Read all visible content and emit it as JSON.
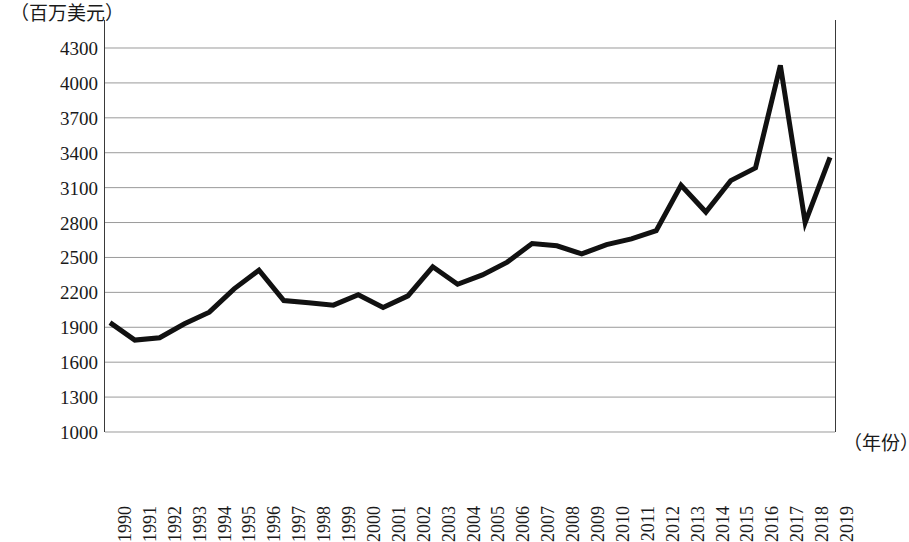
{
  "chart_data": {
    "type": "line",
    "title": "",
    "subtitle": "",
    "xlabel": "（年份）",
    "ylabel": "（百万美元）",
    "ylim": [
      1000,
      4300
    ],
    "ytick_step": 300,
    "yticks": [
      4300,
      4000,
      3700,
      3400,
      3100,
      2800,
      2500,
      2200,
      1900,
      1600,
      1300,
      1000
    ],
    "grid": "horizontal",
    "legend": "none",
    "line_color": "#111111",
    "line_width_px": 5,
    "categories": [
      "1990",
      "1991",
      "1992",
      "1993",
      "1994",
      "1995",
      "1996",
      "1997",
      "1998",
      "1999",
      "2000",
      "2001",
      "2002",
      "2003",
      "2004",
      "2005",
      "2006",
      "2007",
      "2008",
      "2009",
      "2010",
      "2011",
      "2012",
      "2013",
      "2014",
      "2015",
      "2016",
      "2017",
      "2018",
      "2019"
    ],
    "values": [
      1940,
      1790,
      1810,
      1930,
      2030,
      2230,
      2390,
      2130,
      2110,
      2090,
      2180,
      2070,
      2170,
      2420,
      2270,
      2350,
      2460,
      2620,
      2600,
      2530,
      2610,
      2660,
      2730,
      3120,
      2890,
      3160,
      3270,
      4150,
      2800,
      3360
    ],
    "annotations": []
  },
  "axis": {
    "y_unit_label": "（百万美元）",
    "x_unit_label": "（年份）"
  }
}
